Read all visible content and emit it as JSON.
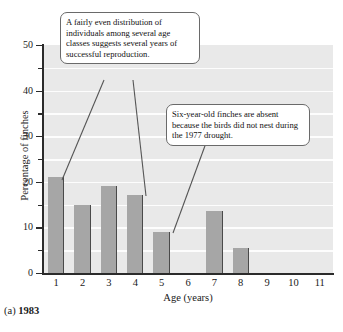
{
  "figure": {
    "caption_label": "(a)",
    "caption_year": "1983"
  },
  "chart_data": {
    "type": "bar",
    "title": "",
    "xlabel": "Age (years)",
    "ylabel": "Percentage of finches",
    "categories": [
      "1",
      "2",
      "3",
      "4",
      "5",
      "6",
      "7",
      "8",
      "9",
      "10",
      "11"
    ],
    "values": [
      21,
      15,
      19,
      17,
      9,
      0,
      13.5,
      5.5,
      0,
      0,
      0
    ],
    "ylim": [
      0,
      50
    ],
    "ytick_major": [
      0,
      10,
      20,
      30,
      40,
      50
    ],
    "ytick_major_labels": [
      "0",
      "10",
      "20",
      "30",
      "40",
      "50"
    ],
    "ytick_minor": [
      5,
      15,
      25,
      35,
      45
    ],
    "gridlines": [
      5,
      10,
      15,
      20,
      25,
      30,
      35,
      40,
      45
    ],
    "grid": true,
    "legend": "none",
    "bar_color": "#a6a6a6",
    "bar_edge_color": "#4a4a4a",
    "plot_background": "#e9e9e9",
    "gridline_color": "#fdfdfd",
    "axis_color": "#2b2b2b"
  },
  "annotations": [
    {
      "id": "callout-1",
      "text": "A fairly even distribution of individuals among several age classes suggests several years of successful reproduction."
    },
    {
      "id": "callout-2",
      "text": "Six-year-old finches are absent because the birds did not nest during the 1977 drought."
    }
  ]
}
